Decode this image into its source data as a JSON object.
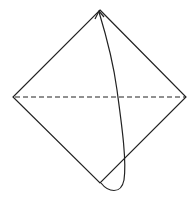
{
  "diagram": {
    "type": "origami-fold",
    "colors": {
      "background": "#ffffff",
      "stroke": "#222222"
    },
    "diamond": {
      "top": [
        100,
        10
      ],
      "right": [
        186,
        97
      ],
      "bottom": [
        100,
        183
      ],
      "left": [
        13,
        97
      ]
    },
    "fold_line": {
      "style": "dashed",
      "from": [
        15,
        97
      ],
      "to": [
        185,
        97
      ]
    },
    "arrow": {
      "from": "bottom-corner",
      "to": "top-corner",
      "direction": "fold-up"
    }
  }
}
